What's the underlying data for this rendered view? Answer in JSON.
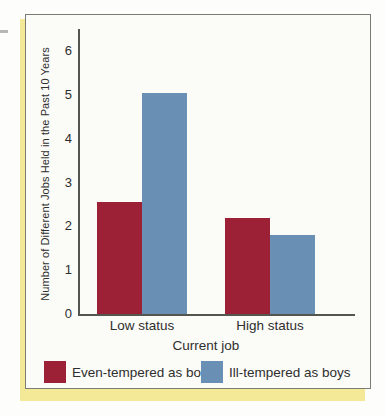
{
  "figure": {
    "background": "#fbfbf8",
    "border_color": "#7b7b73",
    "shadow_color": "#f4e996",
    "axis_color": "#555550",
    "text_color": "#2e2e2e"
  },
  "chart_data": {
    "type": "bar",
    "title": "",
    "categories": [
      "Low status",
      "High status"
    ],
    "series": [
      {
        "name": "Even-tempered as boys",
        "color": "#9c2136",
        "values": [
          2.55,
          2.2
        ]
      },
      {
        "name": "Ill-tempered as boys",
        "color": "#6a8fb4",
        "values": [
          5.05,
          1.8
        ]
      }
    ],
    "xlabel": "Current job",
    "ylabel": "Number of Different Jobs Held in the Past 10 Years",
    "ylim": [
      0,
      6
    ],
    "yticks": [
      0,
      1,
      2,
      3,
      4,
      5,
      6
    ],
    "grid": false,
    "legend_position": "bottom"
  }
}
